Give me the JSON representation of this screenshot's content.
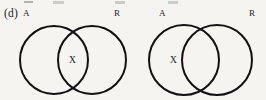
{
  "figure": {
    "part_label": "(d)",
    "background_color": "#f6f4f0",
    "stroke_color": "#111111",
    "text_color": "#1c1c1c",
    "width": 266,
    "height": 100
  },
  "diagrams": [
    {
      "name": "left-venn",
      "labels": {
        "left_set": "A",
        "right_set": "R"
      },
      "marker": {
        "text": "X",
        "region": "intersection"
      }
    },
    {
      "name": "right-venn",
      "labels": {
        "left_set": "A",
        "right_set": "R"
      },
      "marker": {
        "text": "X",
        "region": "left-only"
      }
    }
  ],
  "chart_data": {
    "type": "diagram",
    "subtype": "venn-two-set",
    "title": "(d)",
    "panels": [
      {
        "id": "left",
        "sets": [
          "A",
          "R"
        ],
        "circles": [
          {
            "set": "A",
            "cx": 54,
            "cy": 60,
            "r": 34
          },
          {
            "set": "R",
            "cx": 92,
            "cy": 60,
            "r": 34
          }
        ],
        "markers": [
          {
            "text": "X",
            "region": "A ∩ R",
            "x": 72,
            "y": 61
          }
        ],
        "set_label_positions": [
          {
            "text": "A",
            "x": 26,
            "y": 13
          },
          {
            "text": "R",
            "x": 117,
            "y": 13
          }
        ]
      },
      {
        "id": "right",
        "sets": [
          "A",
          "R"
        ],
        "circles": [
          {
            "set": "A",
            "cx": 184,
            "cy": 60,
            "r": 35
          },
          {
            "set": "R",
            "cx": 217,
            "cy": 60,
            "r": 35
          }
        ],
        "markers": [
          {
            "text": "X",
            "region": "A only",
            "x": 173,
            "y": 61
          }
        ],
        "set_label_positions": [
          {
            "text": "A",
            "x": 162,
            "y": 13
          },
          {
            "text": "R",
            "x": 252,
            "y": 13
          }
        ]
      }
    ]
  }
}
